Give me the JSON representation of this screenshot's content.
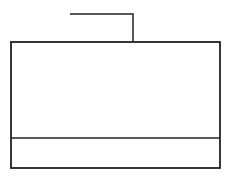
{
  "diagram": {
    "stroke_color": "#222222",
    "background": "#ffffff",
    "connector": {
      "points": [
        [
          70,
          14
        ],
        [
          133,
          14
        ],
        [
          133,
          42
        ]
      ]
    },
    "box": {
      "x": 11,
      "y": 42,
      "width": 209,
      "height": 126
    },
    "divider": {
      "y": 138
    },
    "upper_section": {
      "label": ""
    },
    "lower_section": {
      "label": ""
    }
  }
}
